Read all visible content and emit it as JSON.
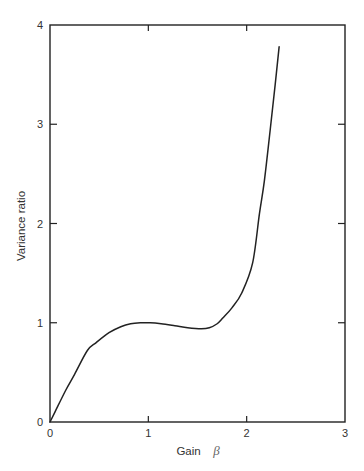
{
  "chart_data": {
    "type": "line",
    "title": "",
    "xlabel": "Gain",
    "xlabel_symbol": "β",
    "ylabel": "Variance ratio",
    "xlim": [
      0,
      3
    ],
    "ylim": [
      0,
      4
    ],
    "xticks": [
      "0",
      "1",
      "2",
      "3"
    ],
    "yticks": [
      "0",
      "1",
      "2",
      "3",
      "4"
    ],
    "grid": false,
    "legend": null,
    "series": [
      {
        "name": "Variance ratio vs gain",
        "x": [
          0,
          0.05,
          0.16,
          0.25,
          0.38,
          0.47,
          0.6,
          0.72,
          0.82,
          0.92,
          1.02,
          1.13,
          1.27,
          1.4,
          1.54,
          1.62,
          1.7,
          1.76,
          1.85,
          1.95,
          2.06,
          2.13,
          2.18,
          2.24,
          2.29,
          2.33
        ],
        "y": [
          0,
          0.1,
          0.32,
          0.48,
          0.72,
          0.8,
          0.9,
          0.96,
          0.99,
          1.0,
          1.0,
          0.99,
          0.97,
          0.95,
          0.94,
          0.95,
          0.99,
          1.05,
          1.15,
          1.3,
          1.6,
          2.1,
          2.43,
          2.95,
          3.4,
          3.78
        ]
      }
    ]
  }
}
